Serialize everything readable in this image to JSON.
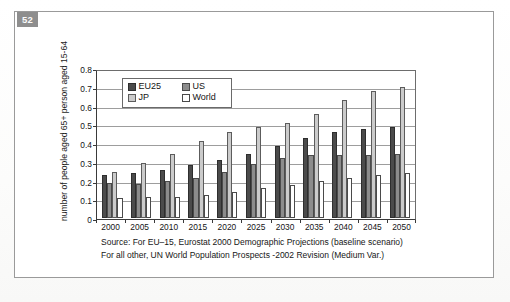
{
  "figure": {
    "badge": "52",
    "caption_prefix": "Figure 5.1",
    "caption_text": "Old-age dependency ratio in the world and 65+ persons per person aged 15"
  },
  "chart_data": {
    "type": "bar",
    "title": "",
    "xlabel": "",
    "ylabel": "number of people aged 65+ person aged 15-64",
    "ylim": [
      0,
      0.8
    ],
    "ytick_labels": [
      "0",
      "0.1",
      "0.2",
      "0.3",
      "0.4",
      "0.5",
      "0.6",
      "0.7",
      "0.8"
    ],
    "ytick_values": [
      0,
      0.1,
      0.2,
      0.3,
      0.4,
      0.5,
      0.6,
      0.7,
      0.8
    ],
    "grid": true,
    "legend_position": "top-left-inside",
    "categories": [
      "2000",
      "2005",
      "2010",
      "2015",
      "2020",
      "2025",
      "2030",
      "2035",
      "2040",
      "2045",
      "2050"
    ],
    "series": [
      {
        "name": "EU25",
        "color": "#4b4b4b",
        "values": [
          0.23,
          0.245,
          0.26,
          0.285,
          0.315,
          0.345,
          0.39,
          0.435,
          0.465,
          0.48,
          0.49
        ]
      },
      {
        "name": "US",
        "color": "#8c8c8c",
        "values": [
          0.19,
          0.185,
          0.2,
          0.215,
          0.25,
          0.29,
          0.325,
          0.34,
          0.34,
          0.34,
          0.345
        ]
      },
      {
        "name": "JP",
        "color": "#cbcbcb",
        "values": [
          0.25,
          0.295,
          0.345,
          0.415,
          0.465,
          0.49,
          0.515,
          0.56,
          0.64,
          0.685,
          0.71
        ]
      },
      {
        "name": "World",
        "color": "#ffffff",
        "values": [
          0.11,
          0.115,
          0.115,
          0.125,
          0.14,
          0.16,
          0.18,
          0.2,
          0.215,
          0.23,
          0.245
        ]
      }
    ],
    "series_baseline": [
      {
        "name": "World-lower",
        "values": [
          0.1,
          0.1,
          0.1,
          0.1,
          0.1,
          0.1,
          0.1,
          0.1,
          0.1,
          0.1,
          0.1
        ]
      }
    ],
    "annotations": {
      "source_line1": "Source: For EU–15, Eurostat 2000 Demographic Projections (baseline scenario)",
      "source_line2": "For all other, UN World Population Prospects -2002 Revision (Medium Var.)"
    }
  }
}
